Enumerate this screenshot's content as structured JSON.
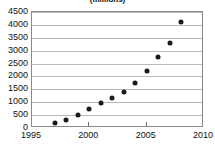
{
  "chart_data": {
    "type": "scatter",
    "title": "(millions)",
    "xlabel": "",
    "ylabel": "",
    "x": [
      1997,
      1998,
      1999,
      2000,
      2001,
      2002,
      2003,
      2004,
      2005,
      2006,
      2007,
      2008
    ],
    "values": [
      200,
      300,
      500,
      730,
      980,
      1150,
      1400,
      1750,
      2200,
      2770,
      3300,
      4100
    ],
    "xlim": [
      1995,
      2010
    ],
    "ylim": [
      0,
      4500
    ],
    "xticks": [
      "1995",
      "2000",
      "2005",
      "2010"
    ],
    "xtick_values": [
      1995,
      2000,
      2005,
      2010
    ],
    "yticks": [
      "0",
      "500",
      "1000",
      "1500",
      "2000",
      "2500",
      "3000",
      "3500",
      "4000",
      "4500"
    ],
    "ytick_values": [
      0,
      500,
      1000,
      1500,
      2000,
      2500,
      3000,
      3500,
      4000,
      4500
    ],
    "grid": "horizontal",
    "legend": null,
    "marker_color": "#1a1a1a",
    "grid_color": "#b9b9b9",
    "frame_color": "#8a8a8a"
  }
}
